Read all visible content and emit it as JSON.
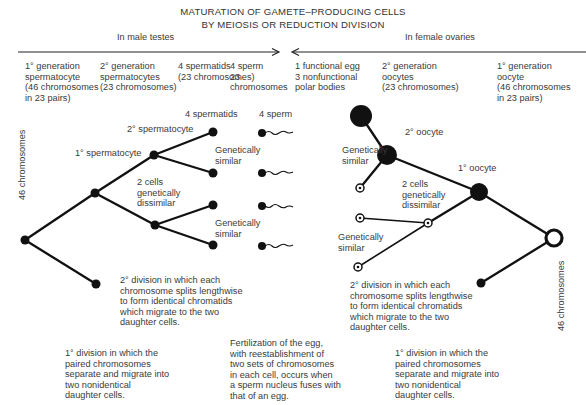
{
  "title": {
    "line1": "MATURATION OF GAMETE–PRODUCING CELLS",
    "line2": "BY MEIOSIS OR REDUCTION DIVISION"
  },
  "male": {
    "heading": "In male testes",
    "stages": [
      "1° generation\nspermatocyte\n(46 chromosomes\nin 23 pairs)",
      "2° generation\nspermatocytes\n(23 chromosomes)",
      "4 spermatids\n(23 chromosomes)",
      "4 sperm\n23\nchromosomes"
    ],
    "side_label": "46 chromosomes",
    "labels": {
      "spermatids": "4 spermatids",
      "sperm": "4 sperm",
      "secondary": "2° spermatocyte",
      "primary": "1° spermatocyte",
      "similar_top": "Genetically\nsimilar",
      "dissimilar": "2 cells\ngenetically\ndissimilar",
      "similar_bottom": "Genetically\nsimilar",
      "second_division": "2° division in which each\nchromosome splits lengthwise\nto form identical chromatids\nwhich migrate to the two\ndaughter cells.",
      "first_division": "1° division in which the\npaired chromosomes\nseparate and migrate into\ntwo nonidentical\ndaughter cells."
    }
  },
  "female": {
    "heading": "In female ovaries",
    "stages": [
      "1 functional egg\n3 nonfunctional\npolar bodies",
      "2° generation\noocytes\n(23 chromosomes)",
      "1° generation\noocyte\n(46 chromosomes\nin 23 pairs)"
    ],
    "side_label": "46 chromosomes",
    "labels": {
      "secondary": "2° oocyte",
      "primary": "1° oocyte",
      "similar_top": "Genetically\nsimilar",
      "dissimilar": "2 cells\ngenetically\ndissimilar",
      "similar_bottom": "Genetically\nsimilar",
      "second_division": "2° division in which each\nchromosome splits lengthwise\nto form identical chromatids\nwhich migrate to the two\ndaughter cells.",
      "first_division": "1° division in which the\npaired chromosomes\nseparate and migrate into\ntwo nonidentical\ndaughter cells."
    }
  },
  "fertilization": "Fertilization of the egg,\nwith reestablishment of\ntwo sets of chromosomes\nin each cell, occurs when\na sperm nucleus fuses with\nthat of an egg.",
  "colors": {
    "ink": "#111111",
    "text": "#3a3a3a"
  }
}
